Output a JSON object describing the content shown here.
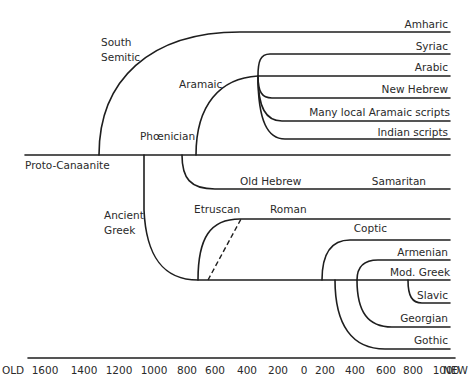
{
  "root": "Proto-Canaanite",
  "branch_labels": {
    "south_semitic": [
      "South",
      "Semitic"
    ],
    "aramaic": "Aramaic",
    "phoenician": "Phœnician",
    "ancient_greek": [
      "Ancient",
      "Greek"
    ],
    "etruscan": "Etruscan",
    "roman": "Roman",
    "old_hebrew": "Old Hebrew"
  },
  "leaves": {
    "amharic": "Amharic",
    "syriac": "Syriac",
    "arabic": "Arabic",
    "new_hebrew": "New Hebrew",
    "many_local_aramaic": "Many local Aramaic scripts",
    "indian": "Indian scripts",
    "samaritan": "Samaritan",
    "coptic": "Coptic",
    "armenian": "Armenian",
    "mod_greek": "Mod. Greek",
    "slavic": "Slavic",
    "georgian": "Georgian",
    "gothic": "Gothic"
  },
  "axis": {
    "start_label": "OLD",
    "end_label": "NEW",
    "ticks": [
      "1600",
      "1400",
      "1200",
      "1000",
      "800",
      "600",
      "400",
      "200",
      "0",
      "200",
      "400",
      "600",
      "800",
      "1000"
    ]
  }
}
